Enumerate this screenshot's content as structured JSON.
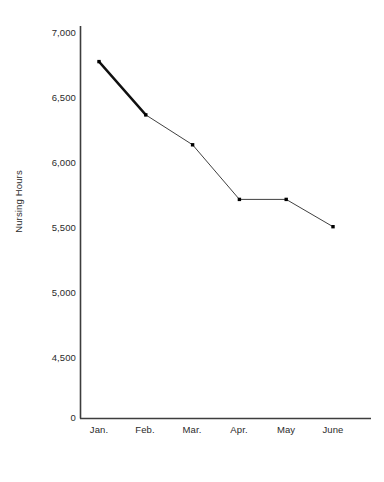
{
  "chart_data": {
    "type": "line",
    "title": "",
    "subtitle": "",
    "xlabel": "Time Period",
    "ylabel": "Nursing Hours",
    "categories": [
      "Jan.",
      "Feb.",
      "Mar.",
      "Apr.",
      "May",
      "June"
    ],
    "values": [
      6780,
      6370,
      6140,
      5720,
      5720,
      5510
    ],
    "series": [
      {
        "name": "Nursing Hours",
        "values": [
          6780,
          6370,
          6140,
          5720,
          5720,
          5510
        ]
      }
    ],
    "ytick_labels": [
      "7,000",
      "6,500",
      "6,000",
      "5,500",
      "5,000",
      "4,500",
      "0"
    ],
    "ytick_values": [
      7000,
      6500,
      6000,
      5500,
      5000,
      4500,
      0
    ],
    "ylim": [
      4500,
      7100
    ],
    "grid": false,
    "legend": "none",
    "axis_break": true,
    "marker": "square",
    "line_color": "#1a1a1a",
    "marker_color": "#000000",
    "axis_color": "#3d3d3d",
    "background_color": "#ffffff"
  }
}
